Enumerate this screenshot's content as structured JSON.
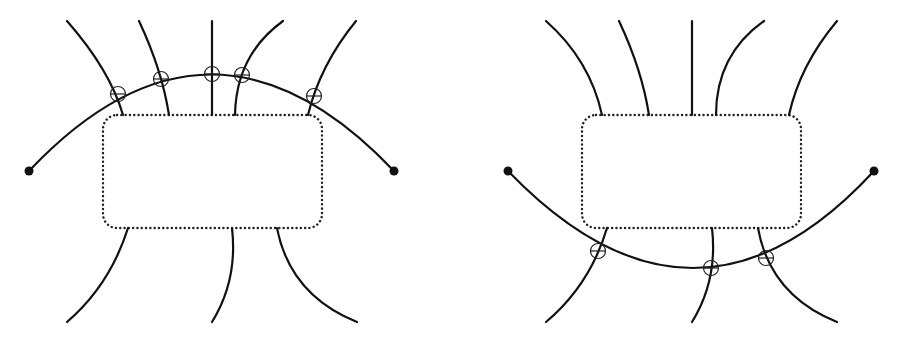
{
  "figure": {
    "panels": [
      {
        "id": "left",
        "box": {
          "x": 103,
          "y": 115,
          "w": 219,
          "h": 113,
          "r": 14,
          "style": "dotted"
        },
        "arc": {
          "start": [
            29,
            171
          ],
          "end": [
            394,
            171
          ],
          "side": "above",
          "ctrl": [
            211,
            -20
          ]
        },
        "endpoints": [
          [
            29,
            171
          ],
          [
            394,
            171
          ]
        ],
        "top_strands": [
          {
            "from": [
              67,
              21
            ],
            "to": [
              123,
              115
            ]
          },
          {
            "from": [
              139,
              21
            ],
            "to": [
              169,
              115
            ]
          },
          {
            "from": [
              212,
              21
            ],
            "to": [
              212,
              115
            ]
          },
          {
            "from": [
              283,
              21
            ],
            "to": [
              235,
              115
            ]
          },
          {
            "from": [
              356,
              21
            ],
            "to": [
              308,
              115
            ]
          }
        ],
        "bottom_strands": [
          {
            "from": [
              128,
              228
            ],
            "to": [
              67,
              322
            ]
          },
          {
            "from": [
              232,
              228
            ],
            "to": [
              212,
              322
            ]
          },
          {
            "from": [
              277,
              228
            ],
            "to": [
              357,
              322
            ]
          }
        ],
        "crossing_markers": [
          [
            118,
            94
          ],
          [
            161,
            79
          ],
          [
            212,
            74
          ],
          [
            242,
            75
          ],
          [
            314,
            96
          ]
        ]
      },
      {
        "id": "right",
        "box": {
          "x": 582,
          "y": 115,
          "w": 219,
          "h": 113,
          "r": 14,
          "style": "dotted"
        },
        "arc": {
          "start": [
            508,
            171
          ],
          "end": [
            874,
            171
          ],
          "side": "below",
          "ctrl": [
            700,
            365
          ]
        },
        "endpoints": [
          [
            508,
            171
          ],
          [
            874,
            171
          ]
        ],
        "top_strands": [
          {
            "from": [
              546,
              21
            ],
            "to": [
              602,
              115
            ]
          },
          {
            "from": [
              619,
              21
            ],
            "to": [
              649,
              115
            ]
          },
          {
            "from": [
              692,
              21
            ],
            "to": [
              692,
              115
            ]
          },
          {
            "from": [
              764,
              21
            ],
            "to": [
              716,
              115
            ]
          },
          {
            "from": [
              837,
              21
            ],
            "to": [
              789,
              115
            ]
          }
        ],
        "bottom_strands": [
          {
            "from": [
              607,
              228
            ],
            "to": [
              546,
              322
            ]
          },
          {
            "from": [
              712,
              228
            ],
            "to": [
              692,
              322
            ]
          },
          {
            "from": [
              758,
              228
            ],
            "to": [
              837,
              322
            ]
          }
        ],
        "crossing_markers": [
          [
            598,
            251
          ],
          [
            711,
            268
          ],
          [
            766,
            258
          ]
        ]
      }
    ],
    "colors": {
      "stroke": "#111111",
      "background": "#ffffff"
    }
  }
}
